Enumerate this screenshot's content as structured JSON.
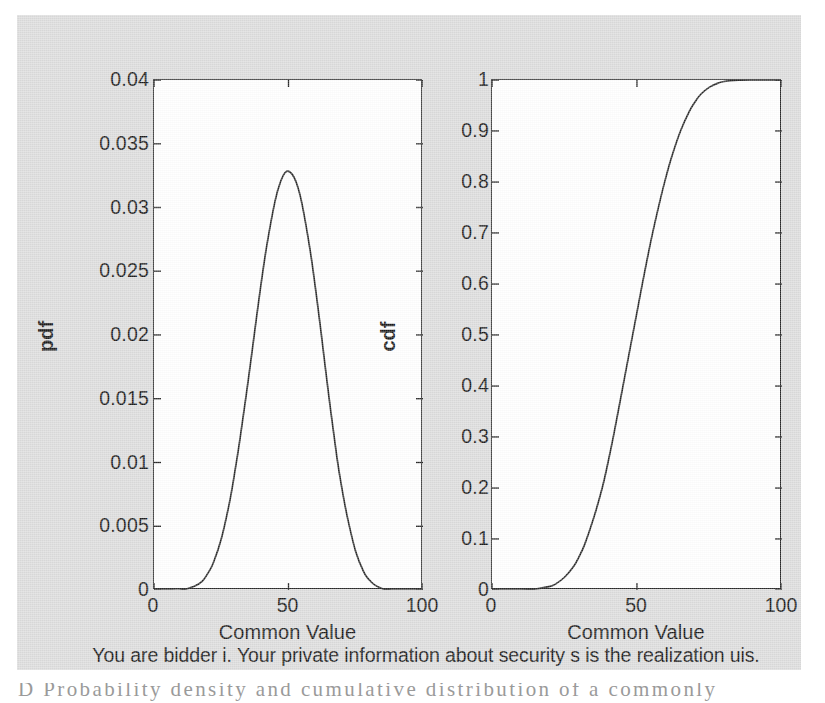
{
  "figure": {
    "note": "You are bidder i. Your private information about security s is the realization uis.",
    "clipped_caption_fragment": "D   Probability density and cumulative distribution of a commonly"
  },
  "chart_data": [
    {
      "id": "pdf",
      "type": "line",
      "title": "",
      "xlabel": "Common Value",
      "ylabel": "pdf",
      "xlim": [
        0,
        100
      ],
      "ylim": [
        0,
        0.04
      ],
      "xticks": [
        0,
        50,
        100
      ],
      "xtick_labels": [
        "0",
        "50",
        "100"
      ],
      "yticks": [
        0,
        0.005,
        0.01,
        0.015,
        0.02,
        0.025,
        0.03,
        0.035,
        0.04
      ],
      "ytick_labels": [
        "0",
        "0.005",
        "0.01",
        "0.015",
        "0.02",
        "0.025",
        "0.03",
        "0.035",
        "0.04"
      ],
      "grid": false,
      "legend": "none",
      "distribution": {
        "family": "normal",
        "mean": 49,
        "sigma": 10.35,
        "peak_value": 0.0386,
        "peak_x": 49
      },
      "x": [
        0,
        5,
        10,
        15,
        18,
        20,
        22,
        25,
        28,
        30,
        32,
        35,
        38,
        40,
        42,
        45,
        47,
        49,
        51,
        53,
        55,
        58,
        60,
        62,
        65,
        68,
        70,
        72,
        75,
        78,
        80,
        82,
        85,
        88,
        90,
        95,
        100
      ],
      "y": [
        0.0,
        0.0,
        0.0,
        0.0003,
        0.0007,
        0.0013,
        0.0021,
        0.004,
        0.0068,
        0.0092,
        0.0119,
        0.0164,
        0.0212,
        0.0243,
        0.0271,
        0.0305,
        0.032,
        0.0328,
        0.0327,
        0.0319,
        0.0303,
        0.0267,
        0.0237,
        0.0204,
        0.0152,
        0.0104,
        0.0078,
        0.0056,
        0.003,
        0.0014,
        0.0008,
        0.0004,
        0.0001,
        0.0,
        0.0,
        0.0,
        0.0
      ],
      "y_display_note": "peak normalized so that maximum drawn height equals 0.0386"
    },
    {
      "id": "cdf",
      "type": "line",
      "title": "",
      "xlabel": "Common Value",
      "ylabel": "cdf",
      "xlim": [
        0,
        100
      ],
      "ylim": [
        0,
        1
      ],
      "xticks": [
        0,
        50,
        100
      ],
      "xtick_labels": [
        "0",
        "50",
        "100"
      ],
      "yticks": [
        0,
        0.1,
        0.2,
        0.3,
        0.4,
        0.5,
        0.6,
        0.7,
        0.8,
        0.9,
        1
      ],
      "ytick_labels": [
        "0",
        "0.1",
        "0.2",
        "0.3",
        "0.4",
        "0.5",
        "0.6",
        "0.7",
        "0.8",
        "0.9",
        "1"
      ],
      "grid": false,
      "legend": "none",
      "distribution": {
        "family": "normal",
        "mean": 52.5,
        "sigma": 10.35,
        "median_x": 52.5,
        "saturation_x": 80
      },
      "x": [
        0,
        10,
        15,
        20,
        22,
        25,
        28,
        30,
        32,
        35,
        38,
        40,
        42,
        45,
        48,
        50,
        52,
        55,
        58,
        60,
        62,
        65,
        68,
        70,
        72,
        75,
        78,
        80,
        85,
        90,
        95,
        100
      ],
      "y": [
        0.0,
        0.0,
        0.002,
        0.007,
        0.012,
        0.025,
        0.045,
        0.065,
        0.09,
        0.14,
        0.2,
        0.25,
        0.305,
        0.395,
        0.485,
        0.545,
        0.605,
        0.69,
        0.765,
        0.81,
        0.85,
        0.9,
        0.938,
        0.957,
        0.972,
        0.986,
        0.994,
        0.997,
        0.9995,
        1.0,
        1.0,
        1.0
      ]
    }
  ],
  "colors": {
    "page_background": "#ffffff",
    "figure_background": "#dcdcdc",
    "axes_background": "#ffffff",
    "axes_border": "#2a2a2a",
    "curve": "#2a2a2a",
    "text": "#1b1b1b"
  }
}
